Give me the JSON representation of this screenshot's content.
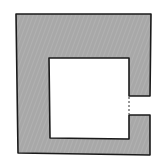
{
  "diagram": {
    "type": "floor-plan",
    "width": 160,
    "height": 162,
    "colors": {
      "background": "#ffffff",
      "wall_fill": "#a8a8a8",
      "wall_stroke": "#1a1a1a",
      "opening_stroke": "#333333"
    },
    "wall_path": "M16,14 L151,14 L150,96 L129,96 L129,58 L49,58 L50,138 L129,139 L129,115 L150,115 L150,155 L18,153 Z",
    "room_interior_path": "M49,58 L129,58 L129,139 L50,138 Z",
    "opening": {
      "x1": 129,
      "y1": 97,
      "x2": 129,
      "y2": 114,
      "style": "dashed"
    }
  }
}
